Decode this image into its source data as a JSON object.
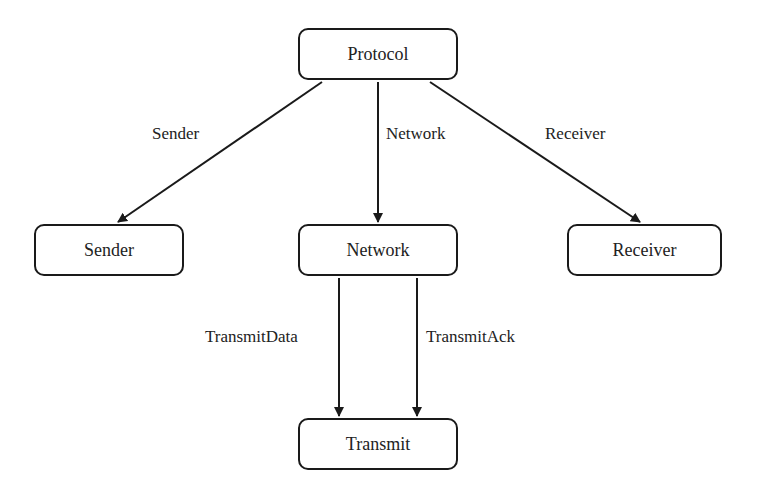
{
  "diagram": {
    "nodes": {
      "protocol": "Protocol",
      "sender": "Sender",
      "network": "Network",
      "receiver": "Receiver",
      "transmit": "Transmit"
    },
    "edges": [
      {
        "from": "Protocol",
        "to": "Sender",
        "label": "Sender"
      },
      {
        "from": "Protocol",
        "to": "Network",
        "label": "Network"
      },
      {
        "from": "Protocol",
        "to": "Receiver",
        "label": "Receiver"
      },
      {
        "from": "Network",
        "to": "Transmit",
        "label": "TransmitData"
      },
      {
        "from": "Network",
        "to": "Transmit",
        "label": "TransmitAck"
      }
    ],
    "colors": {
      "stroke": "#1a1a1a",
      "background": "#ffffff",
      "text": "#222222"
    }
  }
}
